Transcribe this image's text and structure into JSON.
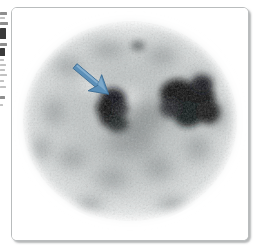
{
  "figure": {
    "caption": "",
    "modality_label": "transaxial nuclear medicine scan",
    "frame": {
      "border_color": "#b9bcbd",
      "background_color": "#ffffff",
      "corner_radius_px": 6,
      "shadow_color": "#787c7e"
    }
  },
  "scan": {
    "name": "transaxial-body-scan",
    "orientation": "transaxial",
    "colormap": "grayscale-inverted",
    "body_outline": {
      "shape": "oval",
      "center_x_pct": 50,
      "center_y_pct": 49,
      "radius_x_pct": 46,
      "radius_y_pct": 44
    },
    "background_color": "#ffffff",
    "tissue_light_color": "#e8eaea",
    "tissue_mid_color": "#b6bbbb",
    "tissue_dark_color": "#7d8384",
    "lesion_color": "#101314",
    "lesions": [
      {
        "id": "lesion-left",
        "label": "left focal uptake",
        "center_x_pct": 44,
        "center_y_pct": 45,
        "width_pct": 13,
        "height_pct": 22,
        "intensity": "high",
        "annotated": true
      },
      {
        "id": "lesion-right",
        "label": "right focal uptake",
        "center_x_pct": 71,
        "center_y_pct": 41,
        "width_pct": 22,
        "height_pct": 22,
        "intensity": "high",
        "annotated": false
      },
      {
        "id": "spot-superior",
        "label": "small superior focus",
        "center_x_pct": 53,
        "center_y_pct": 16,
        "width_pct": 5,
        "height_pct": 4,
        "intensity": "moderate",
        "annotated": false
      }
    ]
  },
  "annotation": {
    "name": "pointer-arrow",
    "type": "arrow",
    "color": "#5b8fb8",
    "outline_color": "#3f6f94",
    "direction": "down-right",
    "tail_x_pct": 28,
    "tail_y_pct": 26,
    "tip_x_pct": 41,
    "tip_y_pct": 38,
    "points_at": "lesion-left"
  },
  "gutter_fragments": [
    {
      "top": 12,
      "width": 7,
      "height": 3,
      "tone": "mid"
    },
    {
      "top": 17,
      "width": 5,
      "height": 2,
      "tone": "pale"
    },
    {
      "top": 22,
      "width": 8,
      "height": 3,
      "tone": "mid"
    },
    {
      "top": 28,
      "width": 6,
      "height": 11,
      "tone": "dark"
    },
    {
      "top": 43,
      "width": 7,
      "height": 3,
      "tone": "mid"
    },
    {
      "top": 48,
      "width": 5,
      "height": 8,
      "tone": "dark"
    },
    {
      "top": 59,
      "width": 4,
      "height": 2,
      "tone": "pale"
    },
    {
      "top": 64,
      "width": 6,
      "height": 2,
      "tone": "pale"
    },
    {
      "top": 69,
      "width": 5,
      "height": 2,
      "tone": "pale"
    },
    {
      "top": 74,
      "width": 7,
      "height": 2,
      "tone": "pale"
    },
    {
      "top": 80,
      "width": 4,
      "height": 2,
      "tone": "pale"
    },
    {
      "top": 86,
      "width": 6,
      "height": 2,
      "tone": "pale"
    },
    {
      "top": 96,
      "width": 5,
      "height": 3,
      "tone": "mid"
    },
    {
      "top": 104,
      "width": 3,
      "height": 2,
      "tone": "pale"
    }
  ]
}
